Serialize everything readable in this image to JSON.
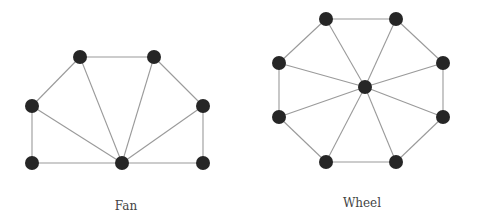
{
  "diagrams": [
    {
      "id": "fan",
      "label": "Fan",
      "label_pos": [
        126,
        199
      ],
      "nodes": [
        {
          "id": "a",
          "x": 80,
          "y": 57
        },
        {
          "id": "b",
          "x": 154,
          "y": 57
        },
        {
          "id": "c",
          "x": 32,
          "y": 106
        },
        {
          "id": "d",
          "x": 203,
          "y": 106
        },
        {
          "id": "e",
          "x": 32,
          "y": 163
        },
        {
          "id": "hub",
          "x": 122,
          "y": 163
        },
        {
          "id": "f",
          "x": 203,
          "y": 163
        }
      ],
      "edges": [
        [
          "e",
          "c"
        ],
        [
          "c",
          "a"
        ],
        [
          "a",
          "b"
        ],
        [
          "b",
          "d"
        ],
        [
          "d",
          "f"
        ],
        [
          "e",
          "hub"
        ],
        [
          "hub",
          "f"
        ],
        [
          "hub",
          "c"
        ],
        [
          "hub",
          "a"
        ],
        [
          "hub",
          "b"
        ],
        [
          "hub",
          "d"
        ]
      ]
    },
    {
      "id": "wheel",
      "label": "Wheel",
      "label_pos": [
        362,
        196
      ],
      "nodes": [
        {
          "id": "n1",
          "x": 326,
          "y": 19
        },
        {
          "id": "n2",
          "x": 396,
          "y": 19
        },
        {
          "id": "n3",
          "x": 443,
          "y": 63
        },
        {
          "id": "n4",
          "x": 443,
          "y": 117
        },
        {
          "id": "n5",
          "x": 396,
          "y": 162
        },
        {
          "id": "n6",
          "x": 326,
          "y": 162
        },
        {
          "id": "n7",
          "x": 279,
          "y": 117
        },
        {
          "id": "n8",
          "x": 279,
          "y": 63
        },
        {
          "id": "hub",
          "x": 365,
          "y": 87
        }
      ],
      "edges": [
        [
          "n1",
          "n2"
        ],
        [
          "n2",
          "n3"
        ],
        [
          "n3",
          "n4"
        ],
        [
          "n4",
          "n5"
        ],
        [
          "n5",
          "n6"
        ],
        [
          "n6",
          "n7"
        ],
        [
          "n7",
          "n8"
        ],
        [
          "n8",
          "n1"
        ],
        [
          "hub",
          "n1"
        ],
        [
          "hub",
          "n2"
        ],
        [
          "hub",
          "n3"
        ],
        [
          "hub",
          "n4"
        ],
        [
          "hub",
          "n5"
        ],
        [
          "hub",
          "n6"
        ],
        [
          "hub",
          "n7"
        ],
        [
          "hub",
          "n8"
        ]
      ]
    }
  ],
  "style": {
    "node_color": "#262626",
    "edge_color": "#9a9a9a",
    "node_radius": 7
  }
}
